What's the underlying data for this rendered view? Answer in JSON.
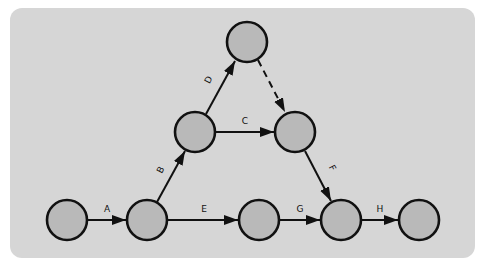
{
  "diagram": {
    "type": "activity-on-arrow network",
    "colors": {
      "page_background": "#ffffff",
      "panel_background": "#d6d6d6",
      "node_fill": "#b9b9b9",
      "stroke": "#111111"
    },
    "nodes": [
      {
        "id": "n1",
        "x": 67,
        "y": 220
      },
      {
        "id": "n2",
        "x": 147,
        "y": 220
      },
      {
        "id": "n3",
        "x": 195,
        "y": 132
      },
      {
        "id": "n4",
        "x": 247,
        "y": 42
      },
      {
        "id": "n5",
        "x": 295,
        "y": 132
      },
      {
        "id": "n6",
        "x": 259,
        "y": 220
      },
      {
        "id": "n7",
        "x": 341,
        "y": 220
      },
      {
        "id": "n8",
        "x": 419,
        "y": 220
      }
    ],
    "edges": [
      {
        "label": "A",
        "from": "n1",
        "to": "n2",
        "style": "solid"
      },
      {
        "label": "B",
        "from": "n2",
        "to": "n3",
        "style": "solid"
      },
      {
        "label": "C",
        "from": "n3",
        "to": "n5",
        "style": "solid"
      },
      {
        "label": "D",
        "from": "n3",
        "to": "n4",
        "style": "solid"
      },
      {
        "label": "",
        "from": "n4",
        "to": "n5",
        "style": "dashed",
        "note": "dummy activity"
      },
      {
        "label": "E",
        "from": "n2",
        "to": "n6",
        "style": "solid"
      },
      {
        "label": "F",
        "from": "n5",
        "to": "n7",
        "style": "solid"
      },
      {
        "label": "G",
        "from": "n6",
        "to": "n7",
        "style": "solid"
      },
      {
        "label": "H",
        "from": "n7",
        "to": "n8",
        "style": "solid"
      }
    ],
    "labels": {
      "A": "A",
      "B": "B",
      "C": "C",
      "D": "D",
      "E": "E",
      "F": "F",
      "G": "G",
      "H": "H"
    }
  }
}
